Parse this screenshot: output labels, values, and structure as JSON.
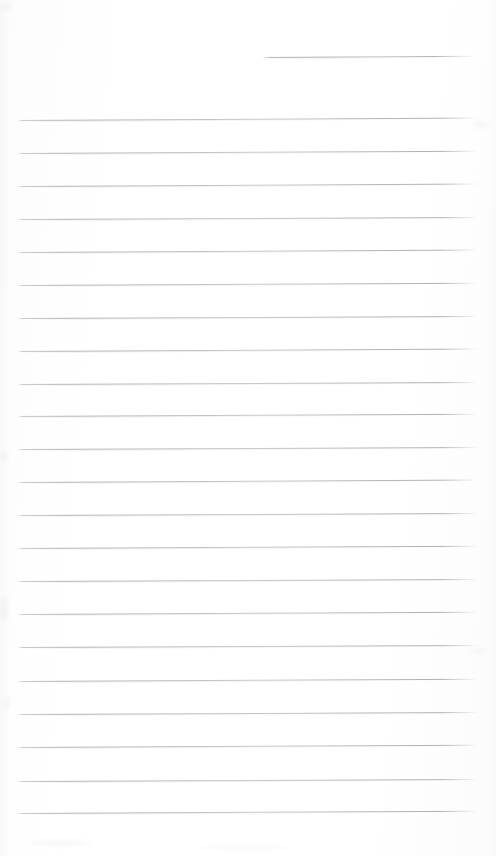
{
  "document": {
    "type": "lined-notepad-page",
    "title": "Blank ruled notepad page",
    "text_content": "",
    "page_width": 496,
    "page_height": 856,
    "background_color": "#ffffff",
    "rule_color": "#b6b6bd",
    "rule_thickness_px": 1,
    "rule_spacing_px": 33.2,
    "rule_left_x": 17,
    "rule_right_x": 478,
    "has_margin_line": false,
    "has_holes": false,
    "is_blank": true
  },
  "partial_rule": {
    "label": "top-right short rule",
    "x_start": 262,
    "x_end": 477,
    "y": 57,
    "tilt_deg": -0.35
  },
  "rules": [
    {
      "y": 120,
      "tilt_deg": -0.3
    },
    {
      "y": 153,
      "tilt_deg": -0.28
    },
    {
      "y": 186,
      "tilt_deg": -0.3
    },
    {
      "y": 219,
      "tilt_deg": -0.26
    },
    {
      "y": 252,
      "tilt_deg": -0.3
    },
    {
      "y": 285,
      "tilt_deg": -0.28
    },
    {
      "y": 318,
      "tilt_deg": -0.26
    },
    {
      "y": 351,
      "tilt_deg": -0.3
    },
    {
      "y": 384,
      "tilt_deg": -0.26
    },
    {
      "y": 416,
      "tilt_deg": -0.28
    },
    {
      "y": 449,
      "tilt_deg": -0.26
    },
    {
      "y": 482,
      "tilt_deg": -0.3
    },
    {
      "y": 515,
      "tilt_deg": -0.26
    },
    {
      "y": 548,
      "tilt_deg": -0.28
    },
    {
      "y": 581,
      "tilt_deg": -0.26
    },
    {
      "y": 614,
      "tilt_deg": -0.28
    },
    {
      "y": 647,
      "tilt_deg": -0.26
    },
    {
      "y": 681,
      "tilt_deg": -0.28
    },
    {
      "y": 714,
      "tilt_deg": -0.26
    },
    {
      "y": 747,
      "tilt_deg": -0.28
    },
    {
      "y": 781,
      "tilt_deg": -0.26
    },
    {
      "y": 813,
      "tilt_deg": -0.28
    }
  ],
  "smudges": [
    {
      "x": 2,
      "y": 3,
      "w": 10,
      "h": 8
    },
    {
      "x": 1,
      "y": 452,
      "w": 8,
      "h": 10
    },
    {
      "x": 0,
      "y": 596,
      "w": 9,
      "h": 26
    },
    {
      "x": 3,
      "y": 696,
      "w": 7,
      "h": 14
    },
    {
      "x": 474,
      "y": 121,
      "w": 14,
      "h": 7
    },
    {
      "x": 470,
      "y": 648,
      "w": 16,
      "h": 6
    },
    {
      "x": 30,
      "y": 840,
      "w": 60,
      "h": 6
    },
    {
      "x": 200,
      "y": 845,
      "w": 90,
      "h": 5
    }
  ]
}
